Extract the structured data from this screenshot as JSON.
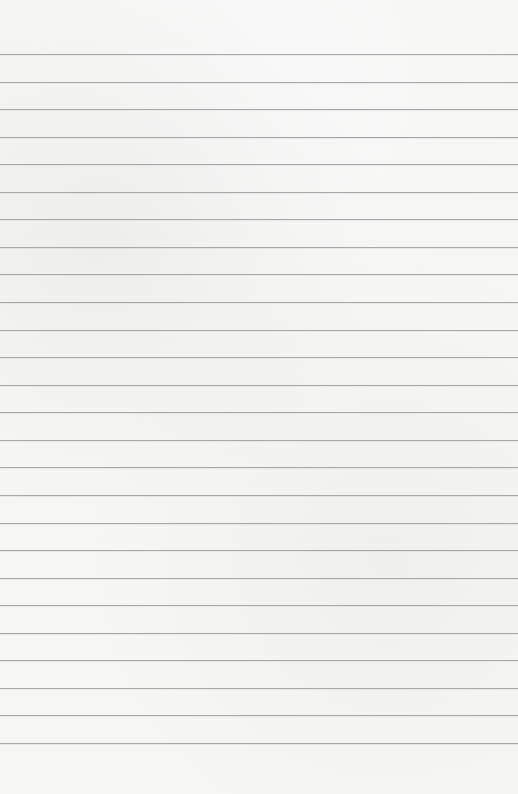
{
  "page": {
    "type": "ruled-paper",
    "background_color": "#f6f6f5",
    "line_color": "#a9a9a9",
    "line_count": 26,
    "first_line_y": 54,
    "line_spacing": 27.56,
    "content_text": ""
  }
}
